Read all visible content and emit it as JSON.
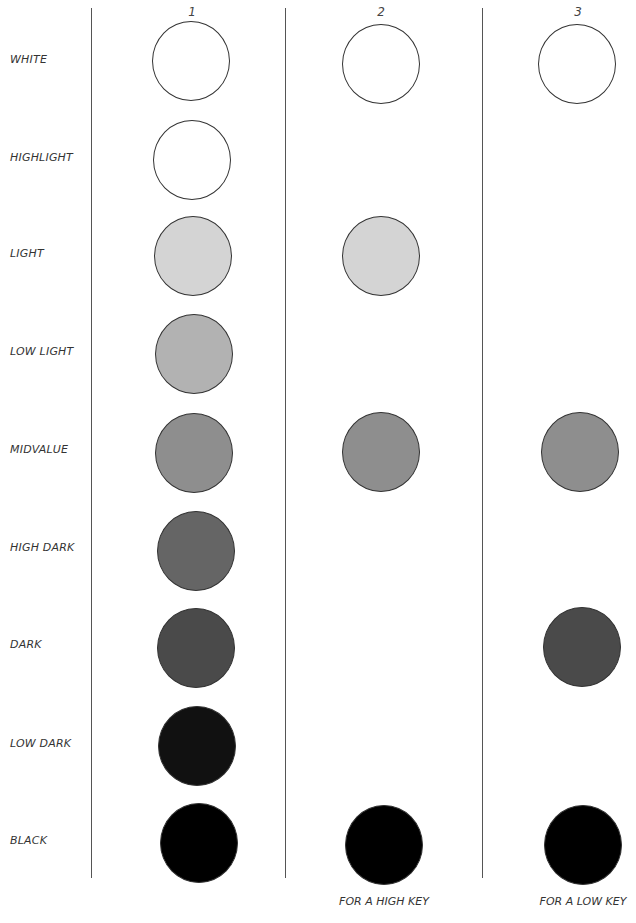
{
  "columns": [
    {
      "label": "1",
      "x": 192,
      "caption": ""
    },
    {
      "label": "2",
      "x": 381,
      "caption": "FOR A HIGH KEY"
    },
    {
      "label": "3",
      "x": 578,
      "caption": "FOR A LOW KEY"
    }
  ],
  "rows": [
    {
      "label": "WHITE",
      "y": 60,
      "color": "#ffffff"
    },
    {
      "label": "HIGHLIGHT",
      "y": 158,
      "color": "#ffffff"
    },
    {
      "label": "LIGHT",
      "y": 254,
      "color": "#d4d4d4"
    },
    {
      "label": "LOW LIGHT",
      "y": 352,
      "color": "#b2b2b2"
    },
    {
      "label": "MIDVALUE",
      "y": 450,
      "color": "#8e8e8e"
    },
    {
      "label": "HIGH DARK",
      "y": 548,
      "color": "#656565"
    },
    {
      "label": "DARK",
      "y": 645,
      "color": "#4a4a4a"
    },
    {
      "label": "LOW DARK",
      "y": 744,
      "color": "#111111"
    },
    {
      "label": "BLACK",
      "y": 841,
      "color": "#000000"
    }
  ],
  "column_values": {
    "1": [
      "WHITE",
      "HIGHLIGHT",
      "LIGHT",
      "LOW LIGHT",
      "MIDVALUE",
      "HIGH DARK",
      "DARK",
      "LOW DARK",
      "BLACK"
    ],
    "2": [
      "WHITE",
      "LIGHT",
      "MIDVALUE",
      "BLACK"
    ],
    "3": [
      "WHITE",
      "MIDVALUE",
      "DARK",
      "BLACK"
    ]
  },
  "captions": {
    "col2": "FOR A HIGH KEY",
    "col3": "FOR A LOW KEY"
  },
  "headers": {
    "col1": "1",
    "col2": "2",
    "col3": "3"
  },
  "labels": {
    "white": "WHITE",
    "highlight": "HIGHLIGHT",
    "light": "LIGHT",
    "low_light": "LOW LIGHT",
    "midvalue": "MIDVALUE",
    "high_dark": "HIGH DARK",
    "dark": "DARK",
    "low_dark": "LOW DARK",
    "black": "BLACK"
  }
}
